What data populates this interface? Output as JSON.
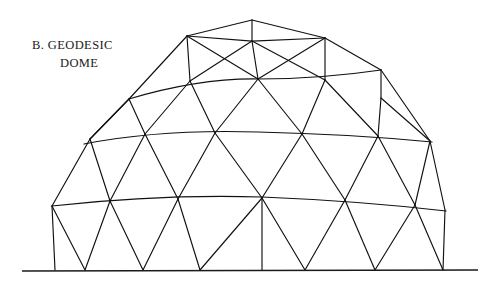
{
  "figure": {
    "kind": "line-drawing",
    "background_color": "#ffffff",
    "ink_color": "#111111",
    "canvas": {
      "width": 503,
      "height": 282
    }
  },
  "caption": {
    "line1": "B. GEODESIC",
    "line2": "DOME",
    "x_line1": 32,
    "y_line1": 49,
    "x_line2": 60,
    "y_line2": 67,
    "color": "#1a1a1a"
  },
  "ground": {
    "label": "ground-line",
    "x1": 22,
    "y1": 271,
    "x2": 478,
    "y2": 270,
    "color": "#1a1a1a"
  },
  "chart_data": {
    "type": "diagram",
    "title": "B. GEODESIC DOME",
    "ring_count": 6,
    "rings": [
      {
        "name": "apex",
        "y": 20,
        "vertices": [
          {
            "x": 252,
            "y": 20
          }
        ]
      },
      {
        "name": "ring-1",
        "y": 38,
        "vertices": [
          {
            "x": 187,
            "y": 36
          },
          {
            "x": 252,
            "y": 41
          },
          {
            "x": 325,
            "y": 38
          }
        ]
      },
      {
        "name": "ring-2",
        "y": 80,
        "vertices": [
          {
            "x": 129,
            "y": 99
          },
          {
            "x": 190,
            "y": 81
          },
          {
            "x": 258,
            "y": 79
          },
          {
            "x": 325,
            "y": 80
          },
          {
            "x": 381,
            "y": 70
          },
          {
            "x": 381,
            "y": 98
          }
        ]
      },
      {
        "name": "ring-3",
        "y": 136,
        "vertices": [
          {
            "x": 90,
            "y": 139
          },
          {
            "x": 145,
            "y": 134
          },
          {
            "x": 215,
            "y": 133
          },
          {
            "x": 302,
            "y": 134
          },
          {
            "x": 378,
            "y": 136
          },
          {
            "x": 430,
            "y": 141
          }
        ]
      },
      {
        "name": "ring-4",
        "y": 203,
        "vertices": [
          {
            "x": 52,
            "y": 206
          },
          {
            "x": 110,
            "y": 201
          },
          {
            "x": 178,
            "y": 199
          },
          {
            "x": 262,
            "y": 198
          },
          {
            "x": 345,
            "y": 200
          },
          {
            "x": 415,
            "y": 205
          },
          {
            "x": 445,
            "y": 210
          }
        ]
      },
      {
        "name": "base",
        "y": 270,
        "vertices": [
          {
            "x": 55,
            "y": 270
          },
          {
            "x": 85,
            "y": 270
          },
          {
            "x": 143,
            "y": 270
          },
          {
            "x": 200,
            "y": 270
          },
          {
            "x": 262,
            "y": 270
          },
          {
            "x": 305,
            "y": 270
          },
          {
            "x": 375,
            "y": 270
          },
          {
            "x": 443,
            "y": 270
          }
        ]
      }
    ],
    "ring_paths": [
      {
        "name": "ring-1-chord",
        "d": "M 187 36 L 252 41 L 325 38"
      },
      {
        "name": "ring-2-chord",
        "d": "M 129 99 Q 200 78 258 79 Q 320 79 381 70"
      },
      {
        "name": "ring-3-chord",
        "d": "M 84 144 Q 160 129 258 132 Q 350 134 432 142"
      },
      {
        "name": "ring-4-chord",
        "d": "M 52 206 Q 160 194 262 197 Q 360 201 446 211"
      }
    ],
    "struts": [
      "M 252 20 L 187 36",
      "M 252 20 L 325 38",
      "M 252 20 L 252 41",
      "M 187 36 L 129 99",
      "M 187 36 L 190 81",
      "M 187 36 L 258 79",
      "M 252 41 L 190 81",
      "M 252 41 L 258 79",
      "M 252 41 L 325 80",
      "M 325 38 L 325 80",
      "M 325 38 L 258 79",
      "M 325 38 L 381 70",
      "M 129 99 L 90 139",
      "M 129 99 L 145 134",
      "M 190 81 L 145 134",
      "M 190 81 L 215 133",
      "M 258 79 L 215 133",
      "M 258 79 L 302 134",
      "M 325 80 L 302 134",
      "M 325 80 L 378 136",
      "M 381 70 L 381 98",
      "M 381 70 L 430 141",
      "M 381 98 L 378 136",
      "M 381 98 L 430 141",
      "M 129 99 L 90 139",
      "M 90 139 L 52 206",
      "M 90 139 L 110 201",
      "M 145 134 L 110 201",
      "M 145 134 L 178 199",
      "M 215 133 L 178 199",
      "M 215 133 L 262 198",
      "M 302 134 L 262 198",
      "M 302 134 L 345 200",
      "M 378 136 L 345 200",
      "M 378 136 L 415 205",
      "M 430 141 L 415 205",
      "M 430 141 L 445 210",
      "M 52 206 L 55 270",
      "M 52 206 L 85 270",
      "M 110 201 L 85 270",
      "M 110 201 L 143 270",
      "M 178 199 L 143 270",
      "M 178 199 L 200 270",
      "M 262 198 L 200 270",
      "M 262 198 L 262 270",
      "M 262 198 L 305 270",
      "M 345 200 L 305 270",
      "M 345 200 L 375 270",
      "M 415 205 L 375 270",
      "M 415 205 L 443 270",
      "M 445 210 L 443 270"
    ]
  }
}
